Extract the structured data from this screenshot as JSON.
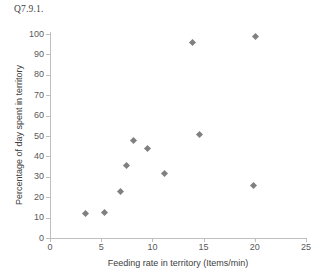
{
  "figure": {
    "title": "Q7.9.1."
  },
  "chart_data": {
    "type": "scatter",
    "title": "Q7.9.1.",
    "xlabel": "Feeding rate in territory (Items/min)",
    "ylabel": "Percentage of day spent in territory",
    "xlim": [
      0,
      25
    ],
    "ylim": [
      0,
      100
    ],
    "xticks": [
      "0",
      "5",
      "10",
      "15",
      "20",
      "25"
    ],
    "yticks": [
      "0",
      "10",
      "20",
      "30",
      "40",
      "50",
      "60",
      "70",
      "80",
      "90",
      "100"
    ],
    "grid": false,
    "legend": false,
    "marker": "diamond",
    "marker_color": "#808080",
    "points": [
      {
        "x": 3.5,
        "y": 11.8
      },
      {
        "x": 5.3,
        "y": 12.3
      },
      {
        "x": 6.9,
        "y": 23.0
      },
      {
        "x": 7.5,
        "y": 35.3
      },
      {
        "x": 8.2,
        "y": 48.0
      },
      {
        "x": 9.5,
        "y": 44.1
      },
      {
        "x": 11.2,
        "y": 31.4
      },
      {
        "x": 13.9,
        "y": 95.6
      },
      {
        "x": 14.6,
        "y": 50.5
      },
      {
        "x": 19.9,
        "y": 25.5
      },
      {
        "x": 20.1,
        "y": 99.0
      }
    ]
  }
}
